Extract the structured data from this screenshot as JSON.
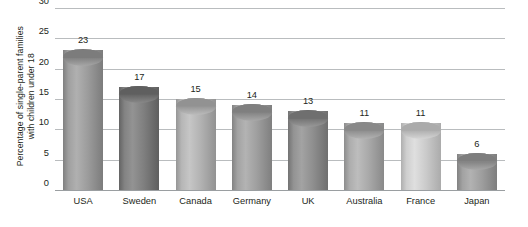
{
  "chart_data": {
    "type": "bar",
    "title": "",
    "subtitle": "",
    "xlabel": "",
    "ylabel": "Percentage of single-parent families with children under 18",
    "ylabel_line1": "Percentage of single-parent families",
    "ylabel_line2": "with children under 18",
    "categories": [
      "USA",
      "Sweden",
      "Canada",
      "Germany",
      "UK",
      "Australia",
      "France",
      "Japan"
    ],
    "values": [
      23,
      17,
      15,
      14,
      13,
      11,
      11,
      6
    ],
    "value_labels": [
      "23",
      "17",
      "15",
      "14",
      "13",
      "11",
      "11",
      "6"
    ],
    "ylim": [
      0,
      30
    ],
    "ytick_values": [
      0,
      5,
      10,
      15,
      20,
      25,
      30
    ],
    "ytick_labels": [
      "0",
      "5",
      "10",
      "15",
      "20",
      "25",
      "30"
    ],
    "grid": true,
    "grid_axis": "y",
    "legend": false,
    "legend_position": "none",
    "bar_style": "3d-cylinder",
    "bar_colors": [
      "#9a9a9a",
      "#7d7d7d",
      "#b0b0b0",
      "#9d9d9d",
      "#8d8d8d",
      "#a7a7a7",
      "#c9c9c9",
      "#9c9c9c"
    ],
    "grid_color": "#b9bcbe",
    "axis_color": "#9a9ea1",
    "text_color": "#231f20",
    "background": "#ffffff"
  }
}
